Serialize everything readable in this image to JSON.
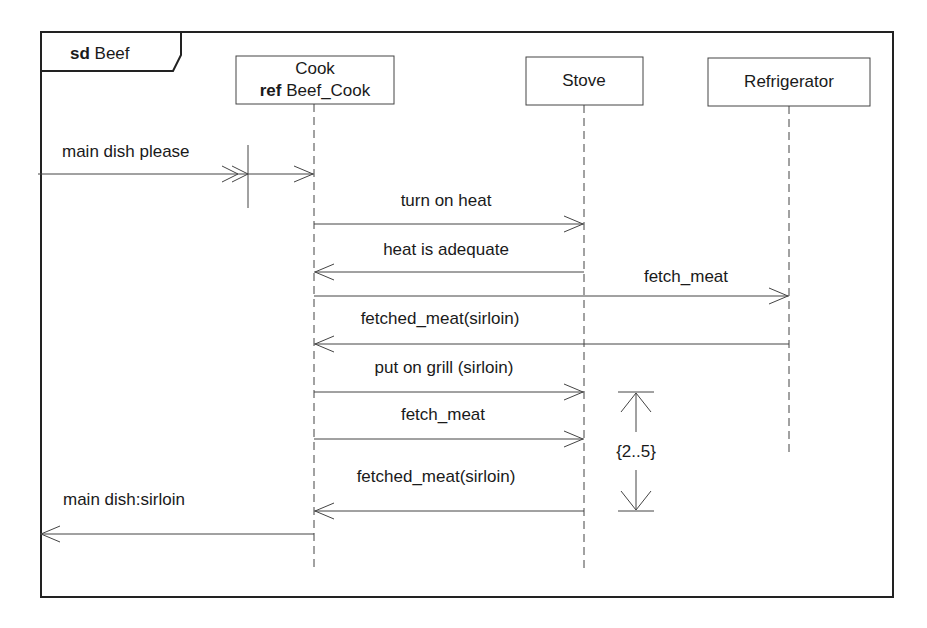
{
  "frame": {
    "keyword": "sd",
    "name": "Beef"
  },
  "lifelines": [
    {
      "id": "cook",
      "name": "Cook",
      "ref_keyword": "ref",
      "ref_name": "Beef_Cook"
    },
    {
      "id": "stove",
      "name": "Stove"
    },
    {
      "id": "refrigerator",
      "name": "Refrigerator"
    }
  ],
  "messages": [
    {
      "label": "main dish please",
      "from": "gate",
      "to": "cook",
      "type": "async"
    },
    {
      "label": "turn on heat",
      "from": "cook",
      "to": "stove",
      "type": "async"
    },
    {
      "label": "heat is adequate",
      "from": "stove",
      "to": "cook",
      "type": "reply"
    },
    {
      "label": "fetch_meat",
      "from": "cook",
      "to": "refrigerator",
      "type": "async"
    },
    {
      "label": "fetched_meat(sirloin)",
      "from": "refrigerator",
      "to": "cook",
      "type": "reply"
    },
    {
      "label": "put on grill (sirloin)",
      "from": "cook",
      "to": "stove",
      "type": "async"
    },
    {
      "label": "fetch_meat",
      "from": "cook",
      "to": "stove",
      "type": "async"
    },
    {
      "label": "fetched_meat(sirloin)",
      "from": "stove",
      "to": "cook",
      "type": "reply"
    },
    {
      "label": "main dish:sirloin",
      "from": "cook",
      "to": "gate",
      "type": "reply"
    }
  ],
  "constraint": {
    "label": "{2..5}",
    "type": "duration"
  }
}
